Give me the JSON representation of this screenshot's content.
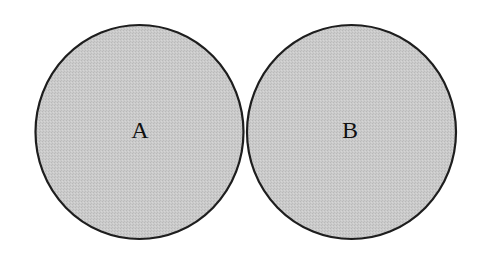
{
  "diagram": {
    "background": "#ffffff",
    "fill_color": "#c9c9c9",
    "stroke_color": "#1e1e1e",
    "stroke_width": 2.2,
    "circles": [
      {
        "label": "A",
        "cx": 139.5,
        "cy": 132,
        "rx": 104,
        "ry": 107
      },
      {
        "label": "B",
        "cx": 351.5,
        "cy": 132,
        "rx": 104.5,
        "ry": 107
      }
    ]
  }
}
